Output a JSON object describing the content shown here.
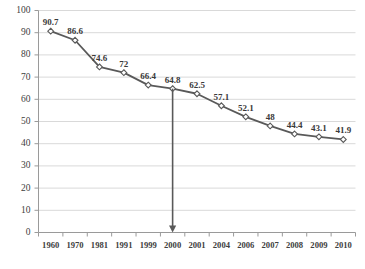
{
  "chart_data": {
    "type": "line",
    "title": "",
    "subtitle": "",
    "xlabel": "",
    "ylabel": "",
    "categories": [
      "1960",
      "1970",
      "1981",
      "1991",
      "1999",
      "2000",
      "2001",
      "2004",
      "2006",
      "2007",
      "2008",
      "2009",
      "2010"
    ],
    "values": [
      90.7,
      86.6,
      74.6,
      72,
      66.4,
      64.8,
      62.5,
      57.1,
      52.1,
      48,
      44.4,
      43.1,
      41.9
    ],
    "data_labels": [
      "90.7",
      "86.6",
      "74.6",
      "72",
      "66.4",
      "64.8",
      "62.5",
      "57.1",
      "52.1",
      "48",
      "44.4",
      "43.1",
      "41.9"
    ],
    "ylim": [
      0,
      100
    ],
    "y_ticks": [
      "0",
      "10",
      "20",
      "30",
      "40",
      "50",
      "60",
      "70",
      "80",
      "90",
      "100"
    ],
    "y_tick_values": [
      0,
      10,
      20,
      30,
      40,
      50,
      60,
      70,
      80,
      90,
      100
    ],
    "grid": true,
    "grid_axis": "y",
    "legend": false,
    "legend_position": "none",
    "marker": "open-diamond",
    "series_color": "#595959",
    "grid_color": "#d9d9d9",
    "axis_color": "#9a9a9a",
    "label_color": "#404040",
    "annotations": [
      {
        "type": "arrow",
        "name": "year-2000-dropline-arrow",
        "from_category": "2000",
        "from_value": 64.8,
        "to_value": 0,
        "direction": "down",
        "color": "#595959"
      }
    ]
  }
}
